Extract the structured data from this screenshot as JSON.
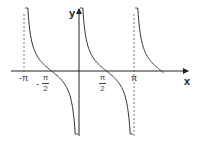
{
  "chart_data": {
    "type": "line",
    "title": "",
    "function": "y = cot x",
    "xlabel": "x",
    "ylabel": "y",
    "x_ticks": [
      "-π",
      "-π/2",
      "π/2",
      "π"
    ],
    "x_tick_values": [
      -3.1416,
      -1.5708,
      1.5708,
      3.1416
    ],
    "asymptotes": [
      -3.1416,
      0,
      3.1416
    ],
    "branches": [
      {
        "domain": [
          -3.1416,
          0
        ],
        "zero_at": -1.5708
      },
      {
        "domain": [
          0,
          3.1416
        ],
        "zero_at": 1.5708
      },
      {
        "domain": [
          3.1416,
          4.9
        ],
        "zero_at": 4.7124
      }
    ],
    "xlim": [
      -4.0,
      5.5
    ],
    "ylim": [
      -4,
      4
    ],
    "grid": false,
    "legend": null
  },
  "labels": {
    "x_axis": "x",
    "y_axis": "y",
    "neg_pi": "-π",
    "neg_sign": "-",
    "pi": "π",
    "pi_num": "π",
    "two": "2"
  },
  "colors": {
    "curve": "#333333",
    "axis": "#222222",
    "asymptote": "#555555"
  }
}
